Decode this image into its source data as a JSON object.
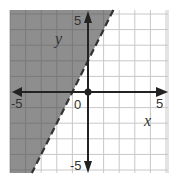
{
  "chart_data": {
    "type": "inequality-graph",
    "title": "",
    "xlabel": "x",
    "ylabel": "y",
    "xlim": [
      -5,
      5
    ],
    "ylim": [
      -5,
      5
    ],
    "grid": true,
    "grid_step": 1,
    "tick_labels": {
      "x_neg": "-5",
      "x_pos": "5",
      "y_pos": "5",
      "y_neg": "-5",
      "origin": "0"
    },
    "boundary_line": {
      "equation": "y = 2x + 2",
      "slope": 2,
      "intercept": 2,
      "style": "dashed",
      "points": [
        [
          -1,
          0
        ],
        [
          0,
          2
        ]
      ]
    },
    "shaded_region": {
      "inequality": "y > 2x + 2",
      "side": "left/above the line",
      "color": "#8e8e8e"
    },
    "marked_point": [
      0,
      0
    ]
  },
  "colors": {
    "shade": "#8e8e8e",
    "grid": "#c8c8c8",
    "grid_on_shade": "#7a7a7a",
    "axis": "#222222",
    "boundary": "#333333"
  }
}
